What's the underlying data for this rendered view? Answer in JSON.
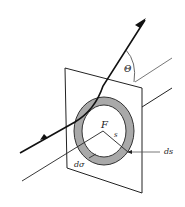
{
  "diagram": {
    "labels": {
      "theta": "Θ",
      "focus": "F",
      "impact_param": "s",
      "ring_width": "ds",
      "cross_section": "dσ"
    },
    "colors": {
      "stroke": "#1a1a1a",
      "ring_fill": "#a9a9a9",
      "plane_fill": "#ffffff",
      "background": "#ffffff"
    }
  }
}
